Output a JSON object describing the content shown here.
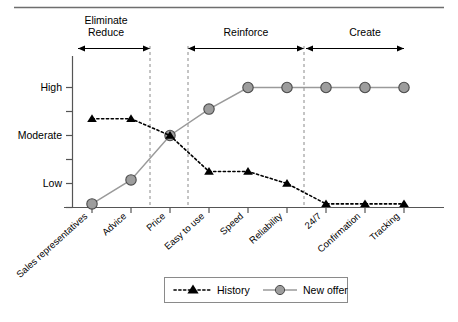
{
  "figure": {
    "top_rule": true,
    "background": "#ffffff",
    "line_color_history": "#000000",
    "line_color_new_offer": "#9a9a9a",
    "marker_fill_new_offer": "#9d9d9d",
    "guide_line_color": "#8a8a8a"
  },
  "chart_data": {
    "type": "line",
    "title": "",
    "xlabel": "",
    "ylabel": "",
    "grid": false,
    "ylim": [
      0,
      5.4
    ],
    "ytick_labels": [
      "Low",
      "Moderate",
      "High"
    ],
    "ytick_values": [
      1,
      3,
      5
    ],
    "minor_ytick_values": [
      0,
      2,
      4
    ],
    "categories": [
      "Sales representatives",
      "Advice",
      "Price",
      "Easy to use",
      "Speed",
      "Reliability",
      "24/7",
      "Confirmation",
      "Tracking"
    ],
    "series": [
      {
        "name": "History",
        "marker": "triangle",
        "linestyle": "dotted",
        "color": "#000000",
        "values": [
          3.7,
          3.7,
          3.0,
          1.5,
          1.5,
          1.0,
          0.15,
          0.15,
          0.15
        ]
      },
      {
        "name": "New offer",
        "marker": "circle",
        "linestyle": "solid",
        "color": "#9a9a9a",
        "values": [
          0.15,
          1.15,
          3.0,
          4.1,
          5.0,
          5.0,
          5.0,
          5.0,
          5.0
        ]
      }
    ],
    "legend": {
      "position": "bottom-center",
      "entries": [
        "History",
        "New offer"
      ]
    },
    "annotations": {
      "group_spans": [
        {
          "label_line1": "Eliminate",
          "label_line2": "Reduce",
          "from_category": "Sales representatives",
          "to_category": "Advice",
          "arrow": "double"
        },
        {
          "label_line1": "Reinforce",
          "label_line2": "",
          "from_category": "Easy to use",
          "to_category": "Reliability",
          "arrow": "double"
        },
        {
          "label_line1": "Create",
          "label_line2": "",
          "from_category": "24/7",
          "to_category": "Tracking",
          "arrow": "double"
        }
      ],
      "divider_lines_after": [
        "Advice",
        "Price",
        "Reliability"
      ]
    }
  },
  "legend": {
    "history_label": "History",
    "new_offer_label": "New offer"
  },
  "axis": {
    "y_high": "High",
    "y_moderate": "Moderate",
    "y_low": "Low"
  },
  "groups": {
    "g1_line1": "Eliminate",
    "g1_line2": "Reduce",
    "g2": "Reinforce",
    "g3": "Create"
  },
  "categories": {
    "c0": "Sales representatives",
    "c1": "Advice",
    "c2": "Price",
    "c3": "Easy to use",
    "c4": "Speed",
    "c5": "Reliability",
    "c6": "24/7",
    "c7": "Confirmation",
    "c8": "Tracking"
  }
}
